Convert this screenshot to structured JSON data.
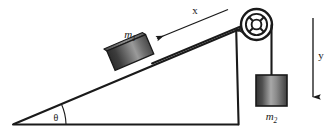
{
  "figure": {
    "type": "physics-free-body-diagram",
    "background_color": "#ffffff",
    "line_color": "#1a1a1a",
    "labels": {
      "mass_incline": "m",
      "mass_incline_subscript": "1",
      "mass_hanging": "m",
      "mass_hanging_subscript": "2",
      "axis_x": "x",
      "axis_y": "y",
      "angle": "θ"
    },
    "geometry": {
      "incline_apex_left": [
        14,
        124
      ],
      "incline_apex_top": [
        238,
        30
      ],
      "incline_base_right": [
        238,
        124
      ],
      "incline_angle_degrees": 23
    },
    "colors": {
      "block_dark": "#3a3a3a",
      "block_mid": "#8c8c8c",
      "block_light": "#d0d0d0",
      "outline": "#1a1a1a"
    },
    "elements": [
      "inclined-plane-triangle",
      "block-m1",
      "pulley-wheel",
      "rope-incline-segment",
      "rope-vertical-segment",
      "block-m2",
      "x-axis-arrow",
      "y-axis-arrow",
      "angle-arc"
    ]
  }
}
